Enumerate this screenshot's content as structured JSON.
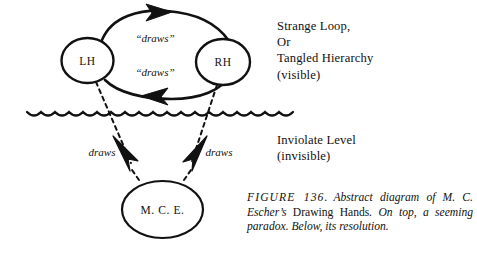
{
  "figure": {
    "nodes": {
      "left_hand": "LH",
      "right_hand": "RH",
      "artist": "M. C. E."
    },
    "edge_labels": {
      "top_draws": "“draws”",
      "bottom_draws": "“draws”",
      "left_draws": "draws",
      "right_draws": "draws"
    },
    "annotations": {
      "upper_level": "Strange Loop,\nOr\nTangled Hierarchy\n(visible)",
      "lower_level": "Inviolate Level\n(invisible)"
    },
    "caption": {
      "figure_number": "FIGURE 136.",
      "text_before": "Abstract diagram of M. C. Escher’s ",
      "work_title": "Drawing Hands",
      "text_after": ". On top, a seeming paradox. Below, its resolution."
    },
    "colors": {
      "ink": "#111111",
      "paper": "#ffffff"
    }
  }
}
